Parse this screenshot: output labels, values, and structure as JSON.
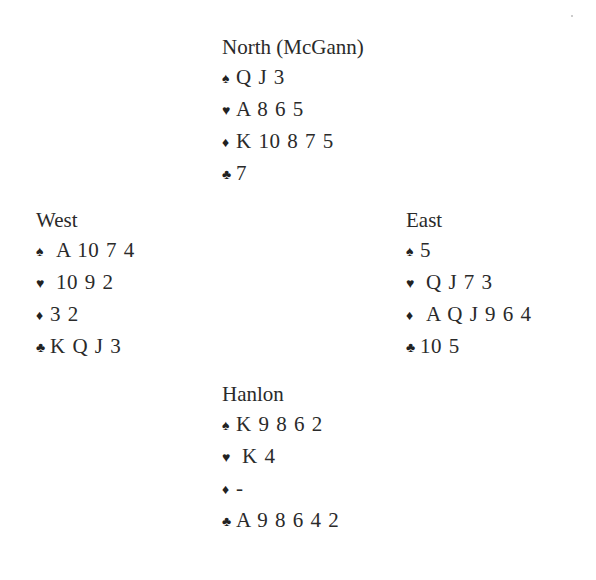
{
  "suit_icons": {
    "spades": "♠",
    "hearts": "♥",
    "diamonds": "♦",
    "clubs": "♣"
  },
  "north": {
    "title": "North (McGann)",
    "spades": "Q J 3",
    "hearts": "A 8 6 5",
    "diamonds": "K 10 8 7 5",
    "clubs": "7"
  },
  "west": {
    "title": "West",
    "spades": "A 10 7 4",
    "hearts": "10 9 2",
    "diamonds": "3 2",
    "clubs": "K Q J 3"
  },
  "east": {
    "title": "East",
    "spades": "5",
    "hearts": "Q J 7 3",
    "diamonds": "A Q J 9 6 4",
    "clubs": "10 5"
  },
  "south": {
    "title": "Hanlon",
    "spades": "K 9 8 6 2",
    "hearts": "K 4",
    "diamonds": "-",
    "clubs": "A 9 8 6 4 2"
  }
}
